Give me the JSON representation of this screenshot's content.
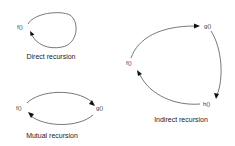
{
  "diagram": {
    "panels": {
      "direct": {
        "caption": "Direct recursion",
        "nodes": [
          {
            "id": "f",
            "label": "f()"
          }
        ],
        "edges": [
          {
            "from": "f",
            "to": "f"
          }
        ]
      },
      "mutual": {
        "caption": "Mutual recursion",
        "nodes": [
          {
            "id": "f",
            "label": "f()"
          },
          {
            "id": "g",
            "label": "g()"
          }
        ],
        "edges": [
          {
            "from": "f",
            "to": "g"
          },
          {
            "from": "g",
            "to": "f"
          }
        ]
      },
      "indirect": {
        "caption": "Indirect recursion",
        "nodes": [
          {
            "id": "f",
            "label": "f()"
          },
          {
            "id": "g",
            "label": "g()"
          },
          {
            "id": "h",
            "label": "h()"
          }
        ],
        "edges": [
          {
            "from": "f",
            "to": "g"
          },
          {
            "from": "g",
            "to": "h"
          },
          {
            "from": "h",
            "to": "f"
          }
        ]
      }
    },
    "colors": {
      "background": "#ffffff",
      "edge": "#555555",
      "arrowhead": "#111111",
      "text": "#222222"
    }
  }
}
